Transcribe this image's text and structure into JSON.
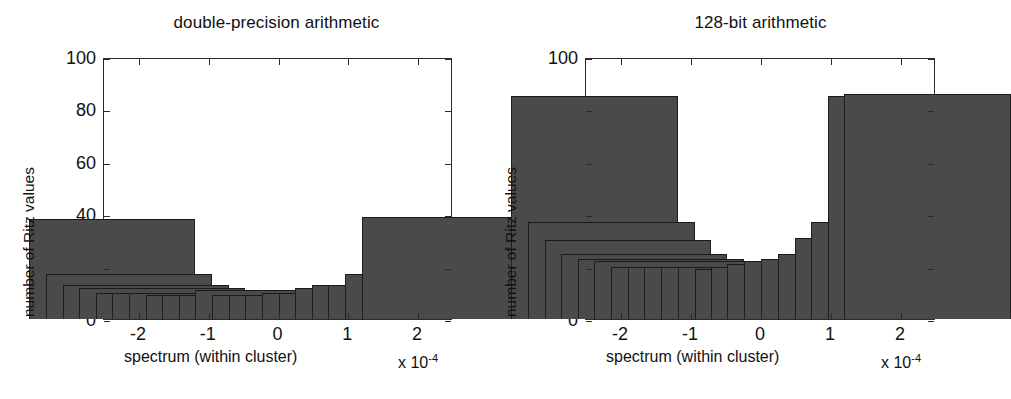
{
  "figure": {
    "background_color": "#ffffff",
    "axis_color": "#2b2b2b",
    "bar_fill_color": "#4a4a4a",
    "bar_edge_color": "#1a1a1a",
    "panel_count": 2
  },
  "shared": {
    "ylabel": "number of Ritz values",
    "xlabel": "spectrum (within cluster)",
    "exponent_prefix": "x 10",
    "exponent_power": "-4",
    "ytick_labels": [
      "0",
      "20",
      "40",
      "60",
      "80",
      "100"
    ],
    "xtick_labels": [
      "-2",
      "-1",
      "0",
      "1",
      "2"
    ]
  },
  "chart_data": [
    {
      "type": "bar",
      "title": "double-precision arithmetic",
      "xlabel": "spectrum (within cluster)",
      "ylabel": "number of Ritz values",
      "x_exponent": "x 10^-4",
      "xlim": [
        -2.5,
        2.5
      ],
      "ylim": [
        0,
        100
      ],
      "yticks": [
        0,
        20,
        40,
        60,
        80,
        100
      ],
      "xticks": [
        -2,
        -1,
        0,
        1,
        2
      ],
      "grid": false,
      "legend": "none",
      "bin_centers": [
        -2.38,
        -2.14,
        -1.9,
        -1.67,
        -1.43,
        -1.19,
        -0.95,
        -0.71,
        -0.48,
        -0.24,
        0.0,
        0.24,
        0.48,
        0.71,
        0.95,
        1.19,
        1.43,
        1.67,
        1.9,
        2.14,
        2.38
      ],
      "values": [
        38,
        17,
        13,
        12,
        10,
        10,
        10,
        9,
        9,
        9,
        11,
        9,
        9,
        9,
        10,
        10,
        12,
        13,
        13,
        17,
        39
      ],
      "bin_width": 0.238
    },
    {
      "type": "bar",
      "title": "128-bit arithmetic",
      "xlabel": "spectrum (within cluster)",
      "ylabel": "number of Ritz values",
      "x_exponent": "x 10^-4",
      "xlim": [
        -2.5,
        2.5
      ],
      "ylim": [
        0,
        100
      ],
      "yticks": [
        0,
        20,
        40,
        60,
        80,
        100
      ],
      "xticks": [
        -2,
        -1,
        0,
        1,
        2
      ],
      "grid": false,
      "legend": "none",
      "bin_centers": [
        -2.38,
        -2.14,
        -1.9,
        -1.67,
        -1.43,
        -1.19,
        -0.95,
        -0.71,
        -0.48,
        -0.24,
        0.0,
        0.24,
        0.48,
        0.71,
        0.95,
        1.19,
        1.43,
        1.67,
        1.9,
        2.14,
        2.38
      ],
      "values": [
        85,
        37,
        30,
        25,
        23,
        22,
        20,
        20,
        20,
        20,
        20,
        19,
        20,
        21,
        22,
        23,
        25,
        31,
        37,
        85,
        86
      ],
      "bin_width": 0.238
    }
  ],
  "panels": [
    {
      "id": "double-precision",
      "title": "double-precision arithmetic"
    },
    {
      "id": "128-bit",
      "title": "128-bit arithmetic"
    }
  ]
}
